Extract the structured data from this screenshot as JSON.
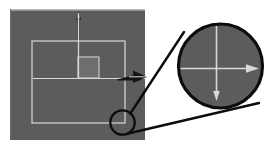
{
  "figure": {
    "caption_visible": false,
    "background_color": "#ffffff",
    "width": 273,
    "height": 147
  },
  "colors": {
    "canvas_background": "#ffffff",
    "field_gray": "#5c5c5c",
    "field_gray_light": "#6f6f6f",
    "inner_square_fill": "#6e6e6e",
    "axis_white": "#d8d8d8",
    "outline_white": "#cfcfcf",
    "callout_black": "#0d0d0d",
    "top_edge_highlight": "#b9b9b9"
  },
  "main_panel": {
    "name": "gray field panel",
    "x": 10,
    "y": 9,
    "width": 135,
    "height": 131,
    "fill": "#5c5c5c"
  },
  "inner_square": {
    "name": "large white outlined square",
    "x": 32,
    "y": 41,
    "width": 93,
    "height": 82,
    "stroke": "#cfcfcf",
    "stroke_width": 1.3
  },
  "small_square": {
    "name": "small lighter square",
    "x": 78,
    "y": 57,
    "width": 21,
    "height": 21,
    "fill": "#6e6e6e",
    "stroke": "#cfcfcf",
    "stroke_width": 1.1
  },
  "axes": {
    "vertical": {
      "label": "y-axis",
      "x": 78.5,
      "y_top": 12,
      "y_bottom": 79,
      "arrow_at": "top",
      "stroke": "#d8d8d8"
    },
    "horizontal": {
      "label": "x-axis",
      "y": 78.5,
      "x_left": 33,
      "x_right": 146,
      "arrow_at": "right",
      "stroke": "#d8d8d8"
    },
    "arrow_dark": {
      "label": "dark x-axis arrowhead",
      "x_start": 118,
      "x_end": 146,
      "y": 77,
      "fill": "#141414"
    }
  },
  "region_marker": {
    "name": "small detail circle",
    "cx": 122.5,
    "cy": 122.5,
    "r": 12.5,
    "stroke": "#0d0d0d",
    "stroke_width": 2.2
  },
  "magnifier": {
    "name": "magnified detail circle",
    "cx": 220.5,
    "cy": 66,
    "r": 43,
    "fill": "#5c5c5c",
    "stroke": "#0d0d0d",
    "stroke_width": 3.2,
    "crosshair": {
      "vertical": {
        "x": 216,
        "y_top": 28,
        "y_bottom": 100,
        "arrow_at": "bottom",
        "stroke": "#d8d8d8"
      },
      "horizontal": {
        "y": 68,
        "x_left": 180,
        "x_right": 258,
        "arrow_at": "right",
        "stroke": "#d8d8d8"
      }
    }
  },
  "connectors": [
    {
      "name": "upper connector line",
      "x1": 131,
      "y1": 114,
      "x2": 182,
      "y2": 33,
      "stroke": "#0d0d0d",
      "stroke_width": 2.4
    },
    {
      "name": "lower connector line",
      "x1": 129,
      "y1": 133,
      "x2": 258,
      "y2": 102,
      "stroke": "#0d0d0d",
      "stroke_width": 2.4
    }
  ]
}
